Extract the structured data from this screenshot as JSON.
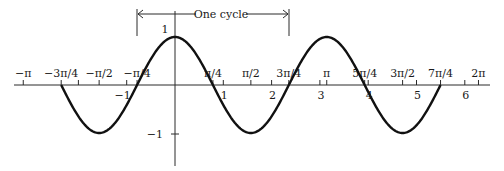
{
  "figure": {
    "function": "y = cos(2x)",
    "annotation": "One cycle",
    "y_ticks": [
      {
        "value": 1,
        "label": "1"
      },
      {
        "value": -1,
        "label": "−1"
      }
    ],
    "x_pi_ticks": [
      {
        "value": -3.14159,
        "label": "−π"
      },
      {
        "value": -2.35619,
        "label": "−3π/4"
      },
      {
        "value": -1.5708,
        "label": "−π/2"
      },
      {
        "value": -0.7854,
        "label": "−π/4"
      },
      {
        "value": 0.7854,
        "label": "π/4"
      },
      {
        "value": 1.5708,
        "label": "π/2"
      },
      {
        "value": 2.35619,
        "label": "3π/4"
      },
      {
        "value": 3.14159,
        "label": "π"
      },
      {
        "value": 3.92699,
        "label": "5π/4"
      },
      {
        "value": 4.71239,
        "label": "3π/2"
      },
      {
        "value": 5.49779,
        "label": "7π/4"
      },
      {
        "value": 6.28319,
        "label": "2π"
      }
    ],
    "x_int_ticks": [
      {
        "value": -2,
        "label": ""
      },
      {
        "value": -1,
        "label": "−1"
      },
      {
        "value": 1,
        "label": "1"
      },
      {
        "value": 2,
        "label": "2"
      },
      {
        "value": 3,
        "label": "3"
      },
      {
        "value": 4,
        "label": "4"
      },
      {
        "value": 5,
        "label": "5"
      },
      {
        "value": 6,
        "label": "6"
      }
    ],
    "cycle_bracket": {
      "start": -0.7854,
      "end": 2.35619,
      "start_label": "−π/4",
      "end_label": "3π/4"
    }
  },
  "chart_data": {
    "type": "line",
    "title": "",
    "xlabel": "",
    "ylabel": "",
    "function": "cos(2x)",
    "period": 3.14159,
    "amplitude": 1,
    "x": [
      -2.356,
      -1.571,
      -0.785,
      0,
      0.785,
      1.571,
      2.356,
      3.142,
      3.927,
      4.712,
      5.498
    ],
    "values": [
      0,
      -1,
      0,
      1,
      0,
      -1,
      0,
      1,
      0,
      -1,
      0
    ],
    "xlim": [
      -3.3,
      6.5
    ],
    "ylim": [
      -1.6,
      1.6
    ],
    "grid": false,
    "annotations": [
      "One cycle (from −π/4 to 3π/4)"
    ],
    "x_tick_labels_top": [
      "−π",
      "−3π/4",
      "−π/2",
      "−π/4",
      "π/4",
      "π/2",
      "3π/4",
      "π",
      "5π/4",
      "3π/2",
      "7π/4",
      "2π"
    ],
    "x_tick_labels_bottom": [
      "−1",
      "1",
      "2",
      "3",
      "4",
      "5",
      "6"
    ],
    "y_tick_labels": [
      "1",
      "−1"
    ]
  }
}
